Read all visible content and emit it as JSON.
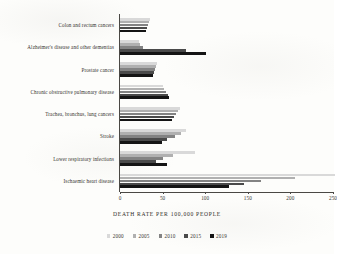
{
  "chart_data": {
    "type": "bar",
    "orientation": "horizontal",
    "title": "",
    "xlabel": "DEATH RATE PER 100,000 PEOPLE",
    "ylabel": "",
    "xlim": [
      0,
      250
    ],
    "xticks": [
      0,
      50,
      100,
      150,
      200,
      250
    ],
    "grid": false,
    "legend_position": "bottom",
    "categories": [
      "Colon and rectum cancers",
      "Alzheimer's disease and other dementias",
      "Prostate cancer",
      "Chronic obstructive pulmonary disease",
      "Trachea, bronchus, lung cancers",
      "Stroke",
      "Lower respiratory infections",
      "Ischaemic heart disease"
    ],
    "series": [
      {
        "name": "2000",
        "color": "#d9d9d9",
        "values": [
          35,
          22,
          43,
          50,
          70,
          78,
          88,
          252
        ]
      },
      {
        "name": "2005",
        "color": "#b0b0b0",
        "values": [
          34,
          24,
          42,
          52,
          68,
          72,
          62,
          205
        ]
      },
      {
        "name": "2010",
        "color": "#838383",
        "values": [
          33,
          27,
          41,
          54,
          66,
          64,
          50,
          165
        ]
      },
      {
        "name": "2015",
        "color": "#4a4a4a",
        "values": [
          32,
          78,
          40,
          56,
          63,
          55,
          42,
          145
        ]
      },
      {
        "name": "2019",
        "color": "#141414",
        "values": [
          31,
          101,
          39,
          57,
          61,
          49,
          55,
          128
        ]
      }
    ]
  },
  "legend": {
    "entries": [
      {
        "label": "2000",
        "color": "#d9d9d9"
      },
      {
        "label": "2005",
        "color": "#b0b0b0"
      },
      {
        "label": "2010",
        "color": "#838383"
      },
      {
        "label": "2015",
        "color": "#4a4a4a"
      },
      {
        "label": "2019",
        "color": "#141414"
      }
    ]
  },
  "axis": {
    "title": "DEATH RATE PER 100,000 PEOPLE",
    "tick_labels": [
      "0",
      "50",
      "100",
      "150",
      "200",
      "250"
    ]
  }
}
